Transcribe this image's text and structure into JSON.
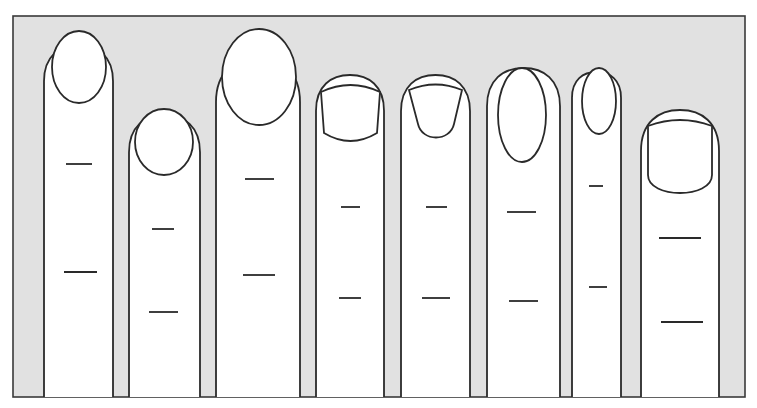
{
  "figure": {
    "width": 757,
    "height": 408,
    "colors": {
      "background": "#ffffff",
      "frame_fill": "#e1e1e1",
      "frame_stroke": "#3a3a3a",
      "finger_fill": "#ffffff",
      "outline": "#2a2a2a"
    },
    "frame": {
      "x": 13,
      "y": 16,
      "w": 732,
      "h": 381
    },
    "fingers": [
      {
        "id": 1,
        "nail_shape": "oval",
        "x1": 44,
        "x2": 113,
        "top": 45,
        "nail": {
          "type": "ellipse",
          "cx": 79,
          "cy": 67,
          "rx": 27,
          "ry": 36
        },
        "creases": [
          {
            "y": 164,
            "x1": 66,
            "x2": 92
          },
          {
            "y": 272,
            "x1": 64,
            "x2": 97
          }
        ]
      },
      {
        "id": 2,
        "nail_shape": "round",
        "x1": 129,
        "x2": 200,
        "top": 115,
        "nail": {
          "type": "ellipse",
          "cx": 164,
          "cy": 142,
          "rx": 29,
          "ry": 33
        },
        "creases": [
          {
            "y": 229,
            "x1": 152,
            "x2": 174
          },
          {
            "y": 312,
            "x1": 149,
            "x2": 178
          }
        ]
      },
      {
        "id": 3,
        "nail_shape": "large-oval",
        "x1": 216,
        "x2": 300,
        "top": 58,
        "nail": {
          "type": "ellipse",
          "cx": 259,
          "cy": 77,
          "rx": 37,
          "ry": 48
        },
        "creases": [
          {
            "y": 179,
            "x1": 245,
            "x2": 274
          },
          {
            "y": 275,
            "x1": 243,
            "x2": 275
          }
        ]
      },
      {
        "id": 4,
        "nail_shape": "square",
        "x1": 316,
        "x2": 384,
        "top": 75,
        "nail": {
          "type": "square",
          "left": 321,
          "right": 380,
          "top": 84,
          "bottom": 143,
          "bottom_curve": 10
        },
        "creases": [
          {
            "y": 207,
            "x1": 341,
            "x2": 360
          },
          {
            "y": 298,
            "x1": 339,
            "x2": 361
          }
        ]
      },
      {
        "id": 5,
        "nail_shape": "fan",
        "x1": 401,
        "x2": 470,
        "top": 75,
        "nail": {
          "type": "fan",
          "left_top": 409,
          "right_top": 462,
          "left_bottom": 418,
          "right_bottom": 454,
          "top": 85,
          "bottom": 140
        },
        "creases": [
          {
            "y": 207,
            "x1": 426,
            "x2": 447
          },
          {
            "y": 298,
            "x1": 422,
            "x2": 450
          }
        ]
      },
      {
        "id": 6,
        "nail_shape": "almond",
        "x1": 487,
        "x2": 560,
        "top": 68,
        "nail": {
          "type": "ellipse",
          "cx": 522,
          "cy": 115,
          "rx": 24,
          "ry": 47
        },
        "creases": [
          {
            "y": 212,
            "x1": 507,
            "x2": 536
          },
          {
            "y": 301,
            "x1": 509,
            "x2": 538
          }
        ]
      },
      {
        "id": 7,
        "nail_shape": "small-oval",
        "x1": 572,
        "x2": 621,
        "top": 72,
        "nail": {
          "type": "ellipse",
          "cx": 599,
          "cy": 101,
          "rx": 17,
          "ry": 33
        },
        "creases": [
          {
            "y": 186,
            "x1": 589,
            "x2": 603
          },
          {
            "y": 287,
            "x1": 589,
            "x2": 607
          }
        ]
      },
      {
        "id": 8,
        "nail_shape": "broad-square",
        "x1": 641,
        "x2": 719,
        "top": 110,
        "nail": {
          "type": "broad",
          "left": 648,
          "right": 712,
          "top": 120,
          "bottom": 195
        },
        "creases": [
          {
            "y": 238,
            "x1": 659,
            "x2": 701
          },
          {
            "y": 322,
            "x1": 661,
            "x2": 703
          }
        ]
      }
    ]
  }
}
